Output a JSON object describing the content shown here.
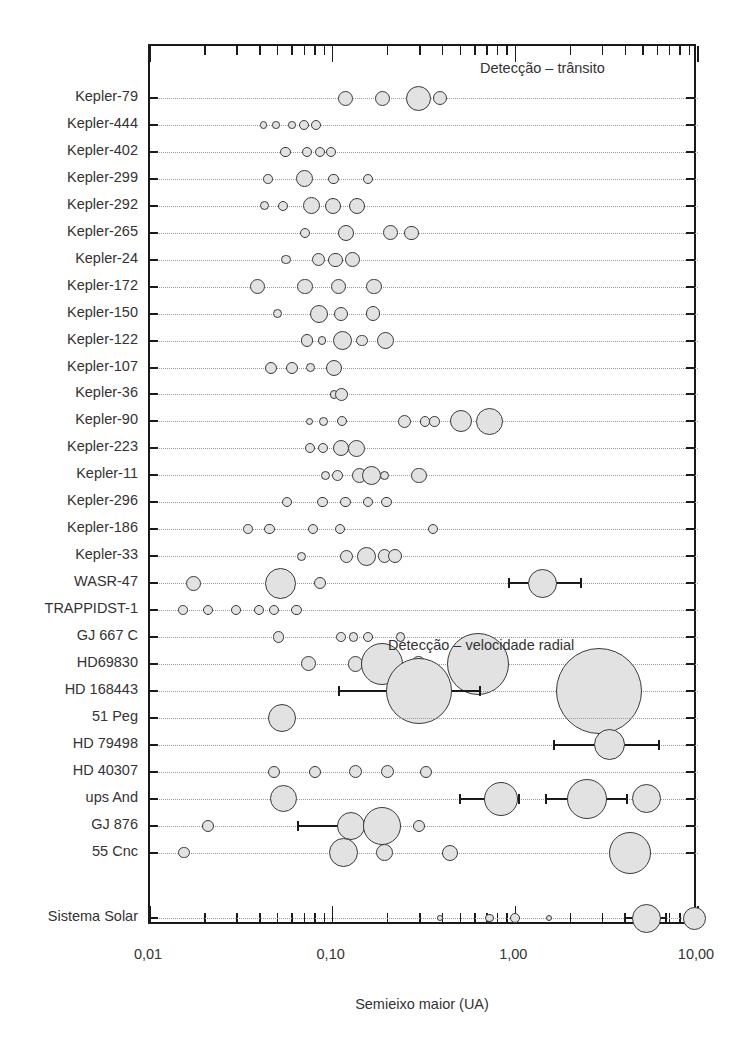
{
  "chart_data": {
    "type": "scatter",
    "title": "",
    "xlabel": "Semieixo maior (UA)",
    "ylabel": "",
    "xscale": "log",
    "xlim": [
      0.01,
      10.0
    ],
    "xticklabels": [
      "0,01",
      "0,10",
      "1,00",
      "10,00"
    ],
    "xtickvalues": [
      0.01,
      0.1,
      1.0,
      10.0
    ],
    "grid": false,
    "legend": "none",
    "annotations": [
      {
        "text": "Detecção – trânsito",
        "x": 0.33,
        "row": "top"
      },
      {
        "text": "Detecção – velocidade radial",
        "x": 0.33,
        "row": "middle"
      }
    ],
    "size_encoding": "marker radius encodes planet radius / mass",
    "series": [
      {
        "name": "Kepler-79",
        "group": "transito",
        "points": [
          {
            "x": 0.117,
            "r": 7.5
          },
          {
            "x": 0.187,
            "r": 7.5
          },
          {
            "x": 0.296,
            "r": 12.5
          },
          {
            "x": 0.386,
            "r": 7.0
          }
        ]
      },
      {
        "name": "Kepler-444",
        "group": "transito",
        "points": [
          {
            "x": 0.0418,
            "r": 3.6
          },
          {
            "x": 0.0488,
            "r": 3.8
          },
          {
            "x": 0.06,
            "r": 3.8
          },
          {
            "x": 0.0696,
            "r": 5.0
          },
          {
            "x": 0.0811,
            "r": 5.0
          }
        ]
      },
      {
        "name": "Kepler-402",
        "group": "transito",
        "points": [
          {
            "x": 0.0553,
            "r": 5.2
          },
          {
            "x": 0.0724,
            "r": 5.2
          },
          {
            "x": 0.0855,
            "r": 5.0
          },
          {
            "x": 0.0977,
            "r": 5.2
          }
        ]
      },
      {
        "name": "Kepler-299",
        "group": "transito",
        "points": [
          {
            "x": 0.0442,
            "r": 4.8
          },
          {
            "x": 0.0703,
            "r": 8.5
          },
          {
            "x": 0.1012,
            "r": 5.2
          },
          {
            "x": 0.1562,
            "r": 5.0
          }
        ]
      },
      {
        "name": "Kepler-292",
        "group": "transito",
        "points": [
          {
            "x": 0.0424,
            "r": 4.6
          },
          {
            "x": 0.0537,
            "r": 5.0
          },
          {
            "x": 0.0764,
            "r": 8.5
          },
          {
            "x": 0.1008,
            "r": 8.2
          },
          {
            "x": 0.1356,
            "r": 8.2
          }
        ]
      },
      {
        "name": "Kepler-265",
        "group": "transito",
        "points": [
          {
            "x": 0.0705,
            "r": 5.0
          },
          {
            "x": 0.1185,
            "r": 8.0
          },
          {
            "x": 0.2065,
            "r": 7.5
          },
          {
            "x": 0.2705,
            "r": 7.2
          }
        ]
      },
      {
        "name": "Kepler-24",
        "group": "transito",
        "points": [
          {
            "x": 0.0557,
            "r": 4.8
          },
          {
            "x": 0.0833,
            "r": 6.5
          },
          {
            "x": 0.1035,
            "r": 7.2
          },
          {
            "x": 0.1292,
            "r": 7.5
          }
        ]
      },
      {
        "name": "Kepler-172",
        "group": "transito",
        "points": [
          {
            "x": 0.0387,
            "r": 7.8
          },
          {
            "x": 0.0705,
            "r": 7.8
          },
          {
            "x": 0.1075,
            "r": 7.8
          },
          {
            "x": 0.1685,
            "r": 7.8
          }
        ]
      },
      {
        "name": "Kepler-150",
        "group": "transito",
        "points": [
          {
            "x": 0.0498,
            "r": 4.5
          },
          {
            "x": 0.0838,
            "r": 9.0
          },
          {
            "x": 0.1115,
            "r": 7.0
          },
          {
            "x": 0.1665,
            "r": 7.2
          }
        ]
      },
      {
        "name": "Kepler-122",
        "group": "transito",
        "points": [
          {
            "x": 0.0724,
            "r": 6.2
          },
          {
            "x": 0.0875,
            "r": 4.4
          },
          {
            "x": 0.1128,
            "r": 9.5
          },
          {
            "x": 0.1452,
            "r": 5.8
          },
          {
            "x": 0.1936,
            "r": 8.5
          }
        ]
      },
      {
        "name": "Kepler-107",
        "group": "transito",
        "points": [
          {
            "x": 0.0457,
            "r": 6.0
          },
          {
            "x": 0.0598,
            "r": 6.0
          },
          {
            "x": 0.0755,
            "r": 4.4
          },
          {
            "x": 0.1018,
            "r": 8.0
          }
        ]
      },
      {
        "name": "Kepler-36",
        "group": "transito",
        "points": [
          {
            "x": 0.1014,
            "r": 4.2
          },
          {
            "x": 0.1122,
            "r": 6.5
          }
        ]
      },
      {
        "name": "Kepler-90",
        "group": "transito",
        "points": [
          {
            "x": 0.0748,
            "r": 3.8
          },
          {
            "x": 0.0889,
            "r": 4.6
          },
          {
            "x": 0.1128,
            "r": 5.0
          },
          {
            "x": 0.2464,
            "r": 6.5
          },
          {
            "x": 0.3211,
            "r": 5.2
          },
          {
            "x": 0.3618,
            "r": 5.2
          },
          {
            "x": 0.5055,
            "r": 11.0
          },
          {
            "x": 0.7184,
            "r": 13.5
          }
        ]
      },
      {
        "name": "Kepler-223",
        "group": "transito",
        "points": [
          {
            "x": 0.0748,
            "r": 5.0
          },
          {
            "x": 0.0885,
            "r": 5.0
          },
          {
            "x": 0.1116,
            "r": 8.0
          },
          {
            "x": 0.1348,
            "r": 8.5
          }
        ]
      },
      {
        "name": "Kepler-11",
        "group": "transito",
        "points": [
          {
            "x": 0.0911,
            "r": 4.6
          },
          {
            "x": 0.1065,
            "r": 5.5
          },
          {
            "x": 0.1398,
            "r": 7.5
          },
          {
            "x": 0.1626,
            "r": 9.5
          },
          {
            "x": 0.1926,
            "r": 4.8
          },
          {
            "x": 0.2978,
            "r": 7.8
          }
        ]
      },
      {
        "name": "Kepler-296",
        "group": "transito",
        "points": [
          {
            "x": 0.0563,
            "r": 5.2
          },
          {
            "x": 0.0878,
            "r": 5.2
          },
          {
            "x": 0.1178,
            "r": 5.2
          },
          {
            "x": 0.1559,
            "r": 5.2
          },
          {
            "x": 0.1969,
            "r": 5.2
          }
        ]
      },
      {
        "name": "Kepler-186",
        "group": "transito",
        "points": [
          {
            "x": 0.0343,
            "r": 4.8
          },
          {
            "x": 0.0452,
            "r": 5.2
          },
          {
            "x": 0.0782,
            "r": 5.2
          },
          {
            "x": 0.1099,
            "r": 5.2
          },
          {
            "x": 0.356,
            "r": 5.0
          }
        ]
      },
      {
        "name": "Kepler-33",
        "group": "transito",
        "points": [
          {
            "x": 0.0677,
            "r": 4.6
          },
          {
            "x": 0.1188,
            "r": 6.5
          },
          {
            "x": 0.1541,
            "r": 9.5
          },
          {
            "x": 0.1925,
            "r": 6.8
          },
          {
            "x": 0.2207,
            "r": 7.0
          }
        ]
      },
      {
        "name": "WASR-47",
        "group": "transito",
        "points": [
          {
            "x": 0.0173,
            "r": 7.5
          },
          {
            "x": 0.0521,
            "r": 15.5
          },
          {
            "x": 0.0855,
            "r": 6.0
          },
          {
            "x": 1.41,
            "r": 14.5,
            "err_low": 0.92,
            "err_high": 2.3
          }
        ]
      },
      {
        "name": "TRAPPIDST-1",
        "group": "transito",
        "points": [
          {
            "x": 0.0152,
            "r": 4.8
          },
          {
            "x": 0.0209,
            "r": 5.0
          },
          {
            "x": 0.0295,
            "r": 5.0
          },
          {
            "x": 0.0393,
            "r": 5.0
          },
          {
            "x": 0.0478,
            "r": 5.0
          },
          {
            "x": 0.0635,
            "r": 5.2
          }
        ]
      },
      {
        "name": "GJ 667 C",
        "group": "velocidade_radial",
        "points": [
          {
            "x": 0.0505,
            "r": 5.8
          },
          {
            "x": 0.1114,
            "r": 4.8
          },
          {
            "x": 0.1299,
            "r": 4.8
          },
          {
            "x": 0.1557,
            "r": 5.2
          },
          {
            "x": 0.2352,
            "r": 4.8
          }
        ]
      },
      {
        "name": "HD69830",
        "group": "velocidade_radial",
        "points": [
          {
            "x": 0.0735,
            "r": 7.5
          },
          {
            "x": 0.1335,
            "r": 7.8
          },
          {
            "x": 0.187,
            "r": 21.0
          },
          {
            "x": 0.2947,
            "r": 7.8
          },
          {
            "x": 0.6285,
            "r": 31.0
          }
        ]
      },
      {
        "name": "HD 168443",
        "group": "velocidade_radial",
        "points": [
          {
            "x": 0.296,
            "r": 33.0,
            "err_low": 0.108,
            "err_high": 0.64
          },
          {
            "x": 2.88,
            "r": 43.0,
            "err_low": 1.72,
            "err_high": 4.8
          }
        ]
      },
      {
        "name": "51 Peg",
        "group": "velocidade_radial",
        "points": [
          {
            "x": 0.0527,
            "r": 14.0
          }
        ]
      },
      {
        "name": "HD 79498",
        "group": "velocidade_radial",
        "points": [
          {
            "x": 3.27,
            "r": 15.5,
            "err_low": 1.63,
            "err_high": 6.1
          }
        ]
      },
      {
        "name": "HD 40307",
        "group": "velocidade_radial",
        "points": [
          {
            "x": 0.0476,
            "r": 6.0
          },
          {
            "x": 0.0801,
            "r": 6.2
          },
          {
            "x": 0.1327,
            "r": 6.5
          },
          {
            "x": 0.2,
            "r": 6.5
          },
          {
            "x": 0.3233,
            "r": 6.2
          }
        ]
      },
      {
        "name": "ups And",
        "group": "velocidade_radial",
        "points": [
          {
            "x": 0.0537,
            "r": 13.5
          },
          {
            "x": 0.8305,
            "r": 17.0,
            "err_low": 0.5,
            "err_high": 1.05
          },
          {
            "x": 2.48,
            "r": 20.0,
            "err_low": 1.48,
            "err_high": 4.1
          },
          {
            "x": 5.25,
            "r": 14.5
          }
        ]
      },
      {
        "name": "GJ 876",
        "group": "velocidade_radial",
        "points": [
          {
            "x": 0.0209,
            "r": 6.0
          },
          {
            "x": 0.1253,
            "r": 14.0,
            "err_low": 0.065,
            "err_high": 0.2
          },
          {
            "x": 0.1855,
            "r": 19.0
          },
          {
            "x": 0.2962,
            "r": 6.0
          }
        ]
      },
      {
        "name": "55 Cnc",
        "group": "velocidade_radial",
        "points": [
          {
            "x": 0.0153,
            "r": 5.8
          },
          {
            "x": 0.1152,
            "r": 14.5
          },
          {
            "x": 0.1934,
            "r": 8.5
          },
          {
            "x": 0.4375,
            "r": 8.0
          },
          {
            "x": 4.22,
            "r": 21.0
          }
        ]
      },
      {
        "name": "Sistema Solar",
        "group": "solar",
        "points": [
          {
            "x": 0.387,
            "r": 2.8
          },
          {
            "x": 0.723,
            "r": 4.2
          },
          {
            "x": 1.0,
            "r": 5.0
          },
          {
            "x": 1.524,
            "r": 3.2
          },
          {
            "x": 5.203,
            "r": 14.5,
            "err_low": 4.0,
            "err_high": 6.7
          },
          {
            "x": 9.537,
            "r": 11.5
          }
        ]
      }
    ]
  },
  "axis": {
    "x_title": "Semieixo maior (UA)",
    "labels": [
      "0,01",
      "0,10",
      "1,00",
      "10,00"
    ]
  },
  "sections": {
    "transit": "Detecção – trânsito",
    "radial": "Detecção – velocidade radial"
  },
  "style": {
    "marker_fill": "#e2e2e2",
    "marker_stroke": "#3a3a3a",
    "axis_color": "#1a1a1a",
    "dotline_color": "#9a9a9a",
    "text_color": "#333333"
  }
}
